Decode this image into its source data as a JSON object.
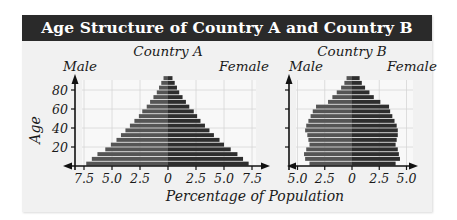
{
  "title": "Age Structure of Country A and Country B",
  "shared_xlabel": "Percentage of Population",
  "shared_ylabel": "Age",
  "colors": {
    "male": "#555555",
    "female": "#2e2e2e",
    "title_bg": "#2a2a2a",
    "panel_bg": "#f1f1f1"
  },
  "chart_data": [
    {
      "type": "bar",
      "subtype": "population-pyramid",
      "title": "Country A",
      "left_label": "Male",
      "right_label": "Female",
      "xlabel": "Percentage of Population",
      "ylabel": "Age",
      "y_ticks": [
        "20",
        "40",
        "60",
        "80"
      ],
      "x_ticks_left": [
        "7.5",
        "5.0",
        "2.5"
      ],
      "x_ticks_right": [
        "0",
        "2.5",
        "5.0",
        "7.5"
      ],
      "xlim": [
        -8,
        8
      ],
      "ylim": [
        0,
        95
      ],
      "grid": true,
      "categories": [
        "0-4",
        "5-9",
        "10-14",
        "15-19",
        "20-24",
        "25-29",
        "30-34",
        "35-39",
        "40-44",
        "45-49",
        "50-54",
        "55-59",
        "60-64",
        "65-69",
        "70-74",
        "75-79",
        "80-84",
        "85-89",
        "90-94"
      ],
      "series": [
        {
          "name": "Male",
          "values": [
            7.3,
            6.8,
            6.3,
            5.6,
            5.1,
            4.6,
            4.2,
            3.8,
            3.4,
            3.0,
            2.6,
            2.3,
            1.9,
            1.6,
            1.3,
            1.0,
            0.8,
            0.6,
            0.4
          ]
        },
        {
          "name": "Female",
          "values": [
            7.2,
            6.7,
            6.2,
            5.6,
            5.0,
            4.6,
            4.1,
            3.7,
            3.3,
            2.9,
            2.6,
            2.3,
            1.9,
            1.6,
            1.3,
            1.0,
            0.8,
            0.6,
            0.4
          ]
        }
      ]
    },
    {
      "type": "bar",
      "subtype": "population-pyramid",
      "title": "Country B",
      "left_label": "Male",
      "right_label": "Female",
      "xlabel": "Percentage of Population",
      "ylabel": "Age",
      "y_ticks": [
        "20",
        "40",
        "60",
        "80"
      ],
      "x_ticks_left": [
        "5.0",
        "2.5"
      ],
      "x_ticks_right": [
        "0",
        "2.5",
        "5.0"
      ],
      "xlim": [
        -5.5,
        5.5
      ],
      "ylim": [
        0,
        95
      ],
      "grid": true,
      "categories": [
        "0-4",
        "5-9",
        "10-14",
        "15-19",
        "20-24",
        "25-29",
        "30-34",
        "35-39",
        "40-44",
        "45-49",
        "50-54",
        "55-59",
        "60-64",
        "65-69",
        "70-74",
        "75-79",
        "80-84",
        "85-89",
        "90-94"
      ],
      "series": [
        {
          "name": "Male",
          "values": [
            3.9,
            4.3,
            4.4,
            4.2,
            3.9,
            4.0,
            4.1,
            4.3,
            4.2,
            4.0,
            3.8,
            3.6,
            3.3,
            2.2,
            1.8,
            1.4,
            1.0,
            0.7,
            0.5
          ]
        },
        {
          "name": "Female",
          "values": [
            4.0,
            4.4,
            4.3,
            4.2,
            4.0,
            4.1,
            4.2,
            4.2,
            4.1,
            3.9,
            3.7,
            3.5,
            3.4,
            2.6,
            2.0,
            1.6,
            1.2,
            0.9,
            0.7
          ]
        }
      ]
    }
  ]
}
